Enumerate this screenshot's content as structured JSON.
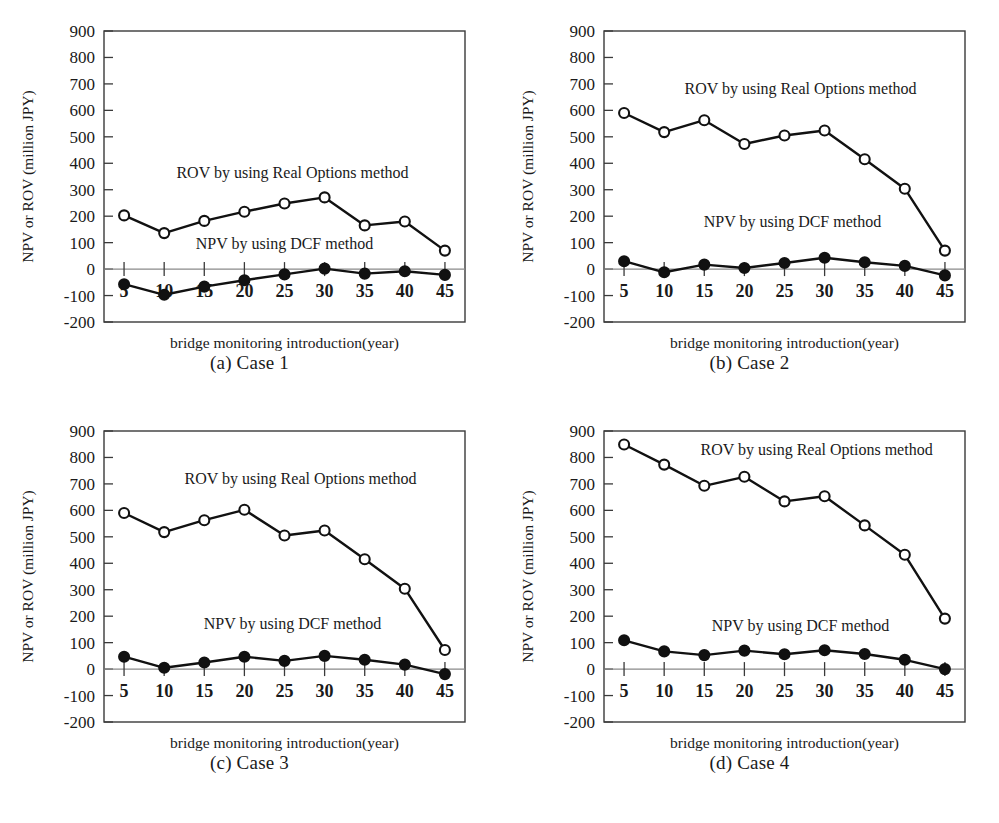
{
  "figure": {
    "axis": {
      "ylabel": "NPV or ROV (million JPY)",
      "xlabel": "bridge monitoring introduction(year)",
      "yticks": [
        "900",
        "800",
        "700",
        "600",
        "500",
        "400",
        "300",
        "200",
        "100",
        "0",
        "-100",
        "-200"
      ],
      "xticks": [
        "5",
        "10",
        "15",
        "20",
        "25",
        "30",
        "35",
        "40",
        "45"
      ],
      "ylim": [
        -200,
        900
      ],
      "xlim": [
        2.5,
        47.5
      ]
    },
    "series_labels": {
      "rov": "ROV by using Real Options method",
      "npv": "NPV by using DCF method"
    },
    "captions": [
      "(a) Case 1",
      "(b) Case 2",
      "(c) Case 3",
      "(d) Case 4"
    ],
    "footnote": ""
  },
  "chart_data": [
    {
      "type": "line",
      "title": "(a) Case 1",
      "xlabel": "bridge monitoring introduction(year)",
      "ylabel": "NPV or ROV (million JPY)",
      "x": [
        5,
        10,
        15,
        20,
        25,
        30,
        35,
        40,
        45
      ],
      "xlim": [
        2.5,
        47.5
      ],
      "ylim": [
        -200,
        900
      ],
      "grid": false,
      "legend": "inline-annotation",
      "series": [
        {
          "name": "ROV by using Real Options method",
          "marker": "open-circle",
          "values": [
            203,
            136,
            182,
            217,
            248,
            271,
            165,
            180,
            70
          ]
        },
        {
          "name": "NPV by using DCF method",
          "marker": "filled-circle",
          "values": [
            -57,
            -97,
            -66,
            -42,
            -20,
            2,
            -17,
            -8,
            -22
          ]
        }
      ]
    },
    {
      "type": "line",
      "title": "(b) Case 2",
      "xlabel": "bridge monitoring introduction(year)",
      "ylabel": "NPV or ROV (million JPY)",
      "x": [
        5,
        10,
        15,
        20,
        25,
        30,
        35,
        40,
        45
      ],
      "xlim": [
        2.5,
        47.5
      ],
      "ylim": [
        -200,
        900
      ],
      "grid": false,
      "legend": "inline-annotation",
      "series": [
        {
          "name": "ROV by using Real Options method",
          "marker": "open-circle",
          "values": [
            590,
            518,
            563,
            473,
            505,
            524,
            415,
            304,
            70
          ]
        },
        {
          "name": "NPV by using DCF method",
          "marker": "filled-circle",
          "values": [
            30,
            -12,
            17,
            4,
            23,
            43,
            26,
            12,
            -24
          ]
        }
      ]
    },
    {
      "type": "line",
      "title": "(c) Case 3",
      "xlabel": "bridge monitoring introduction(year)",
      "ylabel": "NPV or ROV (million JPY)",
      "x": [
        5,
        10,
        15,
        20,
        25,
        30,
        35,
        40,
        45
      ],
      "xlim": [
        2.5,
        47.5
      ],
      "ylim": [
        -200,
        900
      ],
      "grid": false,
      "legend": "inline-annotation",
      "series": [
        {
          "name": "ROV by using Real Options method",
          "marker": "open-circle",
          "values": [
            590,
            518,
            563,
            602,
            505,
            524,
            415,
            304,
            72
          ]
        },
        {
          "name": "NPV by using DCF method",
          "marker": "filled-circle",
          "values": [
            47,
            5,
            25,
            47,
            31,
            50,
            35,
            17,
            -19
          ]
        }
      ]
    },
    {
      "type": "line",
      "title": "(d) Case 4",
      "xlabel": "bridge monitoring introduction(year)",
      "ylabel": "NPV or ROV (million JPY)",
      "x": [
        5,
        10,
        15,
        20,
        25,
        30,
        35,
        40,
        45
      ],
      "xlim": [
        2.5,
        47.5
      ],
      "ylim": [
        -200,
        900
      ],
      "grid": false,
      "legend": "inline-annotation",
      "series": [
        {
          "name": "ROV by using Real Options method",
          "marker": "open-circle",
          "values": [
            849,
            773,
            693,
            727,
            634,
            653,
            543,
            432,
            191
          ]
        },
        {
          "name": "NPV by using DCF method",
          "marker": "filled-circle",
          "values": [
            109,
            67,
            53,
            70,
            56,
            71,
            57,
            35,
            0
          ]
        }
      ]
    }
  ],
  "annotation_positions": [
    {
      "rov": {
        "x": 26,
        "y": 345
      },
      "npv": {
        "x": 25,
        "y": 75
      }
    },
    {
      "rov": {
        "x": 27,
        "y": 660
      },
      "npv": {
        "x": 26,
        "y": 160
      }
    },
    {
      "rov": {
        "x": 27,
        "y": 700
      },
      "npv": {
        "x": 26,
        "y": 150
      }
    },
    {
      "rov": {
        "x": 29,
        "y": 810
      },
      "npv": {
        "x": 27,
        "y": 145
      }
    }
  ]
}
